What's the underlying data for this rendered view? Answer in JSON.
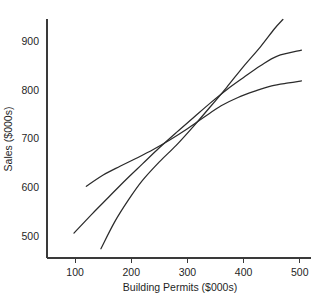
{
  "chart_data": {
    "type": "line",
    "title": "",
    "xlabel": "Building Permits ($000s)",
    "ylabel": "Sales ($000s)",
    "xlim": [
      50,
      520
    ],
    "ylim": [
      455,
      945
    ],
    "xticks": [
      100,
      200,
      300,
      400,
      500
    ],
    "yticks": [
      500,
      600,
      700,
      800,
      900
    ],
    "xtick_labels": [
      "100",
      "200",
      "300",
      "400",
      "500"
    ],
    "ytick_labels": [
      "500",
      "600",
      "700",
      "800",
      "900"
    ],
    "grid": false,
    "legend": "none",
    "series": [
      {
        "name": "upper-band",
        "points": [
          [
            120,
            602
          ],
          [
            150,
            625
          ],
          [
            180,
            643
          ],
          [
            210,
            660
          ],
          [
            240,
            678
          ],
          [
            270,
            698
          ],
          [
            300,
            720
          ],
          [
            330,
            744
          ],
          [
            360,
            767
          ],
          [
            390,
            784
          ],
          [
            420,
            797
          ],
          [
            450,
            808
          ],
          [
            480,
            814
          ],
          [
            503,
            818
          ]
        ]
      },
      {
        "name": "fitted-line",
        "points": [
          [
            98,
            506
          ],
          [
            130,
            545
          ],
          [
            160,
            580
          ],
          [
            190,
            615
          ],
          [
            220,
            648
          ],
          [
            250,
            681
          ],
          [
            280,
            712
          ],
          [
            310,
            742
          ],
          [
            340,
            772
          ],
          [
            370,
            800
          ],
          [
            400,
            825
          ],
          [
            430,
            849
          ],
          [
            460,
            869
          ],
          [
            503,
            881
          ]
        ]
      },
      {
        "name": "lower-band",
        "points": [
          [
            146,
            474
          ],
          [
            170,
            528
          ],
          [
            195,
            574
          ],
          [
            220,
            614
          ],
          [
            250,
            652
          ],
          [
            280,
            686
          ],
          [
            310,
            724
          ],
          [
            340,
            764
          ],
          [
            370,
            805
          ],
          [
            400,
            848
          ],
          [
            430,
            888
          ],
          [
            455,
            925
          ],
          [
            470,
            944
          ]
        ]
      }
    ]
  },
  "axes": {
    "x_title": "Building Permits ($000s)",
    "y_title": "Sales ($000s)"
  }
}
